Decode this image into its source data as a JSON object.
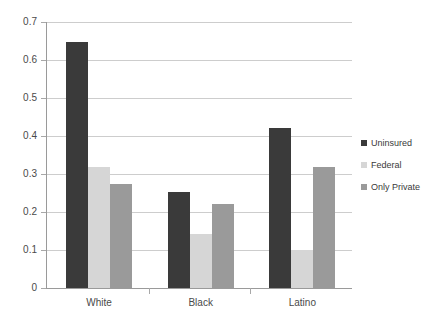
{
  "chart_data": {
    "type": "bar",
    "title": "",
    "subtitle": "",
    "xlabel": "",
    "ylabel": "",
    "categories": [
      "White",
      "Black",
      "Latino"
    ],
    "series": [
      {
        "name": "Uninsured",
        "color": "#3a3a3a",
        "values": [
          0.648,
          0.252,
          0.422
        ]
      },
      {
        "name": "Federal",
        "color": "#d6d6d6",
        "values": [
          0.318,
          0.143,
          0.1
        ]
      },
      {
        "name": "Only Private",
        "color": "#9a9a9a",
        "values": [
          0.275,
          0.222,
          0.318
        ]
      }
    ],
    "ylim": [
      0,
      0.7
    ],
    "ytick_values": [
      0,
      0.1,
      0.2,
      0.3,
      0.4,
      0.5,
      0.6,
      0.7
    ],
    "ytick_labels": [
      "0",
      "0.1",
      "0.2",
      "0.3",
      "0.4",
      "0.5",
      "0.6",
      "0.7"
    ],
    "grid": true,
    "grid_axis": "y",
    "grid_color": "#cdcdcd",
    "legend_position": "right",
    "background_color": "#ffffff",
    "axis_color": "#9a9a9a"
  },
  "legend": {
    "items": [
      {
        "label": "Uninsured"
      },
      {
        "label": "Federal"
      },
      {
        "label": "Only Private"
      }
    ]
  }
}
